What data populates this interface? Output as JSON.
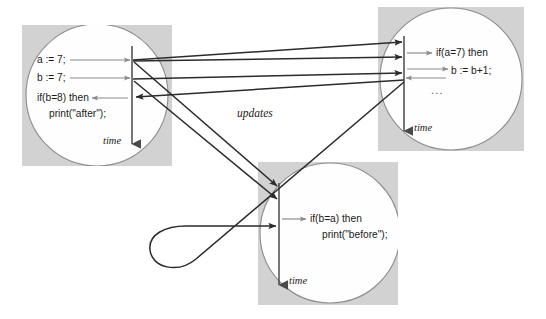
{
  "figure": {
    "title": "updates",
    "background_color": "#ffffff",
    "box_fill": "#d2d2d2",
    "circle_fill": "#fefefe",
    "circle_stroke": "#8d8d8d",
    "timeline_color": "#4a4a4a",
    "message_arrow_color": "#2b2b2b",
    "local_arrow_color": "#8a8a8a"
  },
  "center_label": "updates",
  "processes": [
    {
      "id": "process-left",
      "time_label": "time",
      "lines": [
        {
          "text": "a := 7;",
          "indent": 0
        },
        {
          "text": "b := 7;",
          "indent": 0
        },
        {
          "text": "if(b=8) then",
          "indent": 0
        },
        {
          "text": "print(\"after\");",
          "indent": 1
        }
      ]
    },
    {
      "id": "process-top-right",
      "time_label": "time",
      "lines": [
        {
          "text": "if(a=7) then",
          "indent": 0
        },
        {
          "text": "b := b+1;",
          "indent": 1
        },
        {
          "text": "...",
          "indent": 0
        }
      ]
    },
    {
      "id": "process-bottom",
      "time_label": "time",
      "lines": [
        {
          "text": "if(b=a) then",
          "indent": 0
        },
        {
          "text": "print(\"before\");",
          "indent": 1
        }
      ]
    }
  ]
}
